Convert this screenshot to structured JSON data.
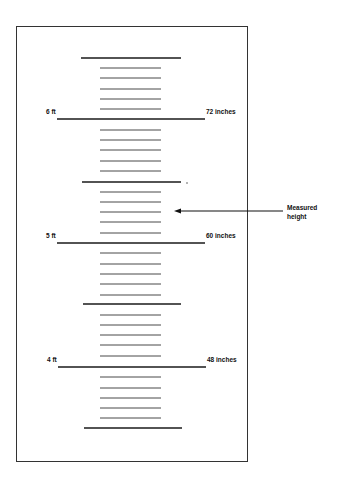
{
  "diagram": {
    "type": "height-measurement-chart",
    "frame": {
      "x": 16,
      "y": 26,
      "width": 231,
      "height": 435
    },
    "ink_color": "#1a1a1a",
    "tick_color": "#333333",
    "ruler": {
      "major_lines": [
        {
          "y": 119,
          "x1": 57,
          "x2": 205,
          "left_label": "6 ft",
          "right_label": "72 inches"
        },
        {
          "y": 243,
          "x1": 57,
          "x2": 205,
          "left_label": "5 ft",
          "right_label": "60 inches"
        },
        {
          "y": 367,
          "x1": 58,
          "x2": 206,
          "left_label": "4 ft",
          "right_label": "48 inches"
        }
      ],
      "half_foot_lines": [
        {
          "y": 58,
          "x1": 81,
          "x2": 181
        },
        {
          "y": 182,
          "x1": 82,
          "x2": 181
        },
        {
          "y": 304,
          "x1": 83,
          "x2": 181
        },
        {
          "y": 428,
          "x1": 84,
          "x2": 182
        }
      ],
      "inch_ticks": {
        "x1": 100,
        "x2": 161,
        "ys": [
          68,
          78,
          89,
          99,
          109,
          130,
          140,
          150,
          161,
          171,
          192,
          202,
          212,
          222,
          233,
          253,
          264,
          274,
          284,
          295,
          315,
          325,
          335,
          345,
          356,
          377,
          388,
          398,
          408,
          418
        ]
      }
    },
    "annotation": {
      "label_line1": "Measured",
      "label_line2": "height",
      "arrow": {
        "from_x": 283,
        "to_x": 174,
        "y": 211
      }
    }
  }
}
